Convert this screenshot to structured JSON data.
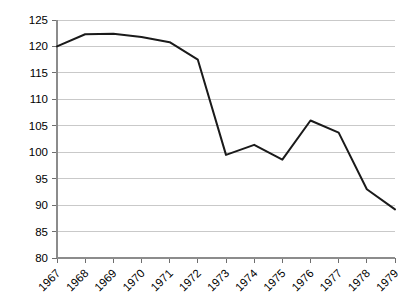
{
  "chart_data": {
    "type": "line",
    "title": "",
    "subtitle": "",
    "xlabel": "",
    "ylabel": "",
    "categories": [
      "1967",
      "1968",
      "1969",
      "1970",
      "1971",
      "1972",
      "1973",
      "1974",
      "1975",
      "1976",
      "1977",
      "1978",
      "1979"
    ],
    "x": [
      1967,
      1968,
      1969,
      1970,
      1971,
      1972,
      1973,
      1974,
      1975,
      1976,
      1977,
      1978,
      1979
    ],
    "values": [
      120.0,
      122.3,
      122.4,
      121.8,
      120.8,
      117.5,
      99.5,
      101.4,
      98.6,
      106.0,
      103.7,
      93.0,
      89.2
    ],
    "series": [
      {
        "name": "",
        "values": [
          120.0,
          122.3,
          122.4,
          121.8,
          120.8,
          117.5,
          99.5,
          101.4,
          98.6,
          106.0,
          103.7,
          93.0,
          89.2
        ]
      }
    ],
    "ylim": [
      80,
      125
    ],
    "xlim": [
      1967,
      1979
    ],
    "ytick_labels": [
      "80",
      "85",
      "90",
      "95",
      "100",
      "105",
      "110",
      "115",
      "120",
      "125"
    ],
    "yticks": [
      80,
      85,
      90,
      95,
      100,
      105,
      110,
      115,
      120,
      125
    ],
    "grid": true,
    "grid_axis": "y",
    "legend": false,
    "legend_position": "none",
    "line_color": "#1a1a1a",
    "grid_color": "#c9c9c9",
    "axis_color": "#8c8c8c",
    "background": "#ffffff",
    "xtick_label_rotation": 45,
    "annotations": []
  }
}
